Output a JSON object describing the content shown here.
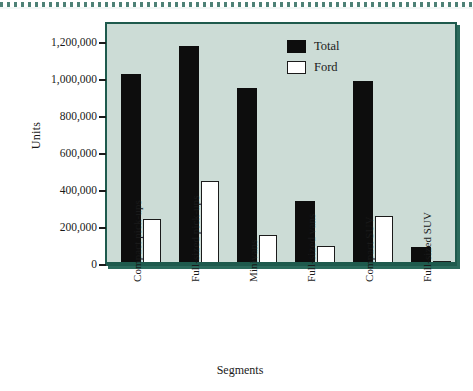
{
  "chart_data": {
    "type": "bar",
    "title": "",
    "xlabel": "Segments",
    "ylabel": "Units",
    "ylim": [
      0,
      1300000
    ],
    "grid": false,
    "legend_position": "top-right",
    "categories": [
      "Compact pick-ups",
      "Full-sized pick-ups",
      "Minivans",
      "Full-sized vans",
      "Compact SUV",
      "Full-sized SUV"
    ],
    "ytick_labels": [
      "0",
      "200,000",
      "400,000",
      "600,000",
      "800,000",
      "1,000,000",
      "1,200,000"
    ],
    "ytick_values": [
      0,
      200000,
      400000,
      600000,
      800000,
      1000000,
      1200000
    ],
    "series": [
      {
        "name": "Total",
        "color": "#0d0d0d",
        "values": [
          1030000,
          1180000,
          955000,
          340000,
          990000,
          90000
        ]
      },
      {
        "name": "Ford",
        "color": "#ffffff",
        "values": [
          245000,
          450000,
          155000,
          100000,
          260000,
          10000
        ]
      }
    ]
  },
  "figure": {
    "plot_background": "#ccdcd6",
    "plot_border": "#1e5a4d",
    "axis_text_color": "#1a1a1a"
  }
}
